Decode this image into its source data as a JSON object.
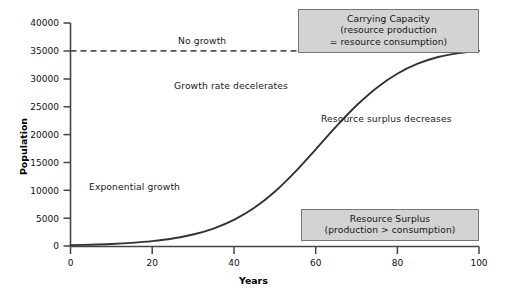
{
  "chart_data": {
    "type": "line",
    "title": "",
    "xlabel": "Years",
    "ylabel": "Population",
    "xlim": [
      0,
      100
    ],
    "ylim": [
      0,
      40000
    ],
    "xticks": [
      0,
      20,
      40,
      60,
      80,
      100
    ],
    "xtick_labels": [
      "0",
      "20",
      "40",
      "60",
      "80",
      "100"
    ],
    "yticks": [
      0,
      5000,
      10000,
      15000,
      20000,
      25000,
      30000,
      35000,
      40000
    ],
    "ytick_labels": [
      "0",
      "5000",
      "10000",
      "15000",
      "20000",
      "25000",
      "30000",
      "35000",
      "40000"
    ],
    "grid": false,
    "legend": "none",
    "series": [
      {
        "name": "Population (logistic growth)",
        "style": "solid",
        "color": "#333333",
        "x": [
          0,
          5,
          10,
          15,
          20,
          25,
          30,
          35,
          40,
          45,
          50,
          55,
          60,
          65,
          70,
          75,
          80,
          85,
          90,
          95,
          100
        ],
        "y": [
          150,
          230,
          360,
          560,
          870,
          1340,
          2060,
          3130,
          4680,
          6850,
          9730,
          13290,
          17300,
          21400,
          25200,
          28400,
          30900,
          32700,
          33900,
          34600,
          35000
        ]
      },
      {
        "name": "Carrying capacity",
        "style": "dashed",
        "color": "#555555",
        "x": [
          0,
          100
        ],
        "y": [
          35000,
          35000
        ]
      }
    ],
    "annotations": [
      {
        "id": "no-growth",
        "text": "No growth",
        "x": 23,
        "y": 37200
      },
      {
        "id": "growth-rate-decelerates",
        "text": "Growth rate decelerates",
        "x": 31,
        "y": 30400
      },
      {
        "id": "resource-surplus-decreases",
        "text": "Resource surplus decreases",
        "x": 71,
        "y": 25700
      },
      {
        "id": "exponential-growth",
        "text": "Exponential growth",
        "x": 19,
        "y": 10900
      }
    ],
    "callouts": [
      {
        "id": "carrying-capacity",
        "lines": [
          "Carrying Capacity",
          "(resource production",
          "= resource consumption)"
        ]
      },
      {
        "id": "resource-surplus",
        "lines": [
          "Resource Surplus",
          "(production > consumption)"
        ]
      }
    ],
    "colors": {
      "curve": "#333333",
      "dashed_line": "#555555",
      "axis": "#444444",
      "callout_fill": "#d3d3d3",
      "callout_border": "#767676",
      "text": "#151515",
      "background": "#ffffff"
    }
  }
}
